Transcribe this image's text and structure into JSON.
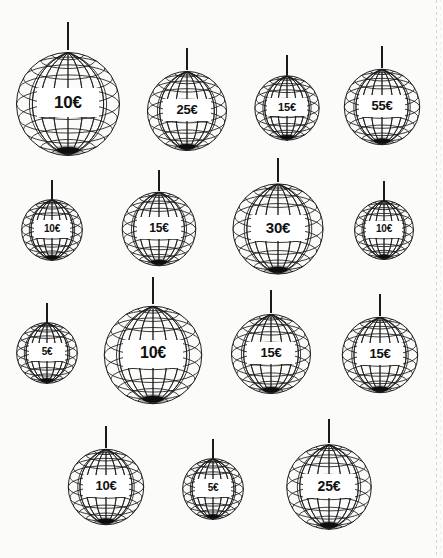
{
  "page": {
    "background_color": "#fbfbfa",
    "ink_color": "#1a1a1a",
    "label_band_color": "#ffffff",
    "currency_symbol": "€"
  },
  "rows": [
    {
      "row_label": "row-1",
      "items": [
        {
          "price": "10€",
          "value": 10,
          "size_px": 112,
          "x": 12,
          "y": 48,
          "string_height": 26
        },
        {
          "price": "25€",
          "value": 25,
          "size_px": 86,
          "x": 144,
          "y": 68,
          "string_height": 20
        },
        {
          "price": "15€",
          "value": 15,
          "size_px": 70,
          "x": 252,
          "y": 73,
          "string_height": 18
        },
        {
          "price": "55€",
          "value": 55,
          "size_px": 82,
          "x": 341,
          "y": 66,
          "string_height": 20
        }
      ]
    },
    {
      "row_label": "row-2",
      "items": [
        {
          "price": "10€",
          "value": 10,
          "size_px": 66,
          "x": 19,
          "y": 197,
          "string_height": 17
        },
        {
          "price": "15€",
          "value": 15,
          "size_px": 80,
          "x": 119,
          "y": 189,
          "string_height": 19
        },
        {
          "price": "30€",
          "value": 30,
          "size_px": 98,
          "x": 229,
          "y": 180,
          "string_height": 22
        },
        {
          "price": "10€",
          "value": 10,
          "size_px": 64,
          "x": 352,
          "y": 198,
          "string_height": 17
        }
      ]
    },
    {
      "row_label": "row-3",
      "items": [
        {
          "price": "5€",
          "value": 5,
          "size_px": 66,
          "x": 14,
          "y": 320,
          "string_height": 17
        },
        {
          "price": "10€",
          "value": 10,
          "size_px": 106,
          "x": 100,
          "y": 302,
          "string_height": 25
        },
        {
          "price": "15€",
          "value": 15,
          "size_px": 86,
          "x": 228,
          "y": 311,
          "string_height": 21
        },
        {
          "price": "15€",
          "value": 15,
          "size_px": 82,
          "x": 339,
          "y": 314,
          "string_height": 20
        }
      ]
    },
    {
      "row_label": "row-4",
      "items": [
        {
          "price": "10€",
          "value": 10,
          "size_px": 82,
          "x": 65,
          "y": 446,
          "string_height": 20
        },
        {
          "price": "5€",
          "value": 5,
          "size_px": 66,
          "x": 180,
          "y": 456,
          "string_height": 17
        },
        {
          "price": "25€",
          "value": 25,
          "size_px": 92,
          "x": 283,
          "y": 441,
          "string_height": 22
        }
      ]
    }
  ]
}
